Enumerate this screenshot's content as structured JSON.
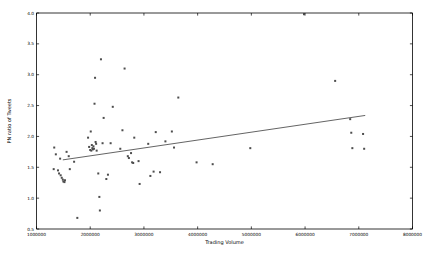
{
  "chart_data": {
    "type": "scatter",
    "title": "",
    "xlabel": "Trading Volume",
    "ylabel": "PN ratio of Tweets",
    "xlim": [
      1000000,
      8000000
    ],
    "ylim": [
      0.5,
      4.0
    ],
    "xticks": [
      1000000,
      2000000,
      3000000,
      4000000,
      5000000,
      6000000,
      7000000,
      8000000
    ],
    "xtick_labels": [
      "1000000",
      "2000000",
      "3000000",
      "4000000",
      "5000000",
      "6000000",
      "7000000",
      "8000000"
    ],
    "yticks": [
      0.5,
      1.0,
      1.5,
      2.0,
      2.5,
      3.0,
      3.5,
      4.0
    ],
    "ytick_labels": [
      "0.5",
      "1.0",
      "1.5",
      "2.0",
      "2.5",
      "3.0",
      "3.5",
      "4.0"
    ],
    "grid": false,
    "legend": null,
    "marker": "square",
    "marker_size": 2.0,
    "point_color": "#4d4d4d",
    "line_color": "#3c3c3c",
    "frame_color": "#000000",
    "background": "#ffffff",
    "points": [
      [
        1320000,
        1.47
      ],
      [
        1330000,
        1.82
      ],
      [
        1360000,
        1.71
      ],
      [
        1400000,
        1.45
      ],
      [
        1420000,
        1.4
      ],
      [
        1440000,
        1.64
      ],
      [
        1450000,
        1.37
      ],
      [
        1470000,
        1.33
      ],
      [
        1490000,
        1.3
      ],
      [
        1500000,
        1.27
      ],
      [
        1520000,
        1.26
      ],
      [
        1530000,
        1.29
      ],
      [
        1560000,
        1.75
      ],
      [
        1600000,
        1.68
      ],
      [
        1620000,
        1.47
      ],
      [
        1700000,
        1.59
      ],
      [
        1760000,
        0.68
      ],
      [
        1960000,
        1.98
      ],
      [
        1980000,
        1.83
      ],
      [
        2000000,
        1.78
      ],
      [
        2010000,
        2.08
      ],
      [
        2020000,
        1.77
      ],
      [
        2030000,
        1.86
      ],
      [
        2040000,
        1.81
      ],
      [
        2050000,
        1.79
      ],
      [
        2060000,
        1.84
      ],
      [
        2070000,
        1.8
      ],
      [
        2080000,
        2.53
      ],
      [
        2090000,
        2.95
      ],
      [
        2100000,
        1.91
      ],
      [
        2110000,
        1.88
      ],
      [
        2120000,
        1.77
      ],
      [
        2150000,
        1.4
      ],
      [
        2170000,
        1.02
      ],
      [
        2180000,
        0.8
      ],
      [
        2200000,
        3.25
      ],
      [
        2230000,
        1.89
      ],
      [
        2250000,
        2.3
      ],
      [
        2300000,
        1.31
      ],
      [
        2330000,
        1.38
      ],
      [
        2380000,
        1.89
      ],
      [
        2420000,
        2.48
      ],
      [
        2560000,
        1.8
      ],
      [
        2600000,
        2.1
      ],
      [
        2640000,
        3.1
      ],
      [
        2700000,
        1.68
      ],
      [
        2720000,
        1.65
      ],
      [
        2760000,
        1.73
      ],
      [
        2780000,
        1.58
      ],
      [
        2800000,
        1.57
      ],
      [
        2820000,
        1.98
      ],
      [
        2900000,
        1.6
      ],
      [
        2920000,
        1.23
      ],
      [
        3080000,
        1.88
      ],
      [
        3120000,
        1.36
      ],
      [
        3180000,
        1.43
      ],
      [
        3220000,
        2.07
      ],
      [
        3300000,
        1.42
      ],
      [
        3400000,
        1.92
      ],
      [
        3520000,
        2.08
      ],
      [
        3560000,
        1.82
      ],
      [
        3640000,
        2.63
      ],
      [
        3980000,
        1.58
      ],
      [
        4280000,
        1.55
      ],
      [
        4980000,
        1.81
      ],
      [
        5980000,
        3.98
      ],
      [
        6560000,
        2.9
      ],
      [
        6840000,
        2.28
      ],
      [
        6860000,
        2.06
      ],
      [
        6880000,
        1.81
      ],
      [
        7080000,
        2.04
      ],
      [
        7100000,
        1.8
      ]
    ],
    "fit_line": {
      "x": [
        1490000,
        7120000
      ],
      "y": [
        1.62,
        2.34
      ]
    }
  }
}
